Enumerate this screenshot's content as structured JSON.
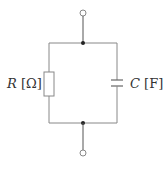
{
  "diagram": {
    "type": "circuit",
    "components": [
      {
        "id": "R",
        "kind": "resistor",
        "label": "R",
        "unit": "Ω",
        "label_text": "R [Ω]"
      },
      {
        "id": "C",
        "kind": "capacitor",
        "label": "C",
        "unit": "F",
        "label_text": "C [F]"
      }
    ],
    "terminals": [
      {
        "id": "top",
        "kind": "open-terminal"
      },
      {
        "id": "bottom",
        "kind": "open-terminal"
      }
    ],
    "junctions": [
      {
        "id": "top-node"
      },
      {
        "id": "bottom-node"
      }
    ],
    "labels": {
      "resistor_symbol": "R",
      "resistor_unit": "[Ω]",
      "capacitor_symbol": "C",
      "capacitor_unit": "[F]"
    },
    "colors": {
      "wire": "#808080",
      "lead": "#555555",
      "dot": "#222222",
      "text": "#333333"
    }
  }
}
